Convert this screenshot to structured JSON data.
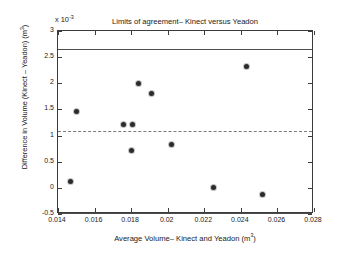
{
  "chart_data": {
    "type": "scatter",
    "title": "Limits of agreement– Kinect versus Yeadon",
    "xlabel": "Average Volume– Kinect and Yeadon (m³)",
    "ylabel": "Difference in Volume (Kinect – Yeadon) (m³)",
    "y_exponent_label": "x 10",
    "y_exponent_value": "-3",
    "y_scale_factor": 0.001,
    "xlim": [
      0.014,
      0.028
    ],
    "ylim": [
      -0.5,
      3.0
    ],
    "grid": false,
    "legend": "none",
    "xticks": [
      0.014,
      0.016,
      0.018,
      0.02,
      0.022,
      0.024,
      0.026,
      0.028
    ],
    "xtick_labels": [
      "0.014",
      "0.016",
      "0.018",
      "0.02",
      "0.022",
      "0.024",
      "0.026",
      "0.028"
    ],
    "yticks": [
      -0.5,
      0,
      0.5,
      1,
      1.5,
      2,
      2.5,
      3
    ],
    "ytick_labels": [
      "-0.5",
      "0",
      "0.5",
      "1",
      "1.5",
      "2",
      "2.5",
      "3"
    ],
    "x": [
      0.0147,
      0.015,
      0.0176,
      0.018,
      0.0181,
      0.0184,
      0.0191,
      0.0202,
      0.0225,
      0.0243,
      0.0252
    ],
    "y": [
      0.12,
      1.47,
      1.22,
      0.72,
      1.21,
      2.0,
      1.81,
      0.83,
      0.0,
      2.33,
      -0.13
    ],
    "points": [
      {
        "x": 0.0147,
        "y": 0.12
      },
      {
        "x": 0.015,
        "y": 1.47
      },
      {
        "x": 0.0176,
        "y": 1.22
      },
      {
        "x": 0.018,
        "y": 0.72
      },
      {
        "x": 0.0181,
        "y": 1.21
      },
      {
        "x": 0.0184,
        "y": 2.0
      },
      {
        "x": 0.0191,
        "y": 1.81
      },
      {
        "x": 0.0202,
        "y": 0.83
      },
      {
        "x": 0.0225,
        "y": 0.0
      },
      {
        "x": 0.0243,
        "y": 2.33
      },
      {
        "x": 0.0252,
        "y": -0.13
      }
    ],
    "reference_lines": [
      {
        "name": "upper-limit-of-agreement",
        "y": 2.65,
        "style": "solid"
      },
      {
        "name": "mean-difference",
        "y": 1.08,
        "style": "dashed"
      },
      {
        "name": "lower-limit-of-agreement",
        "y": -0.48,
        "style": "solid"
      }
    ],
    "marker_color": "#2b2b2b",
    "line_color": "#4d4d4d",
    "dashed_line_color": "#7a7a7a",
    "axis_color": "#3c3c3c",
    "background_color": "#ffffff"
  }
}
